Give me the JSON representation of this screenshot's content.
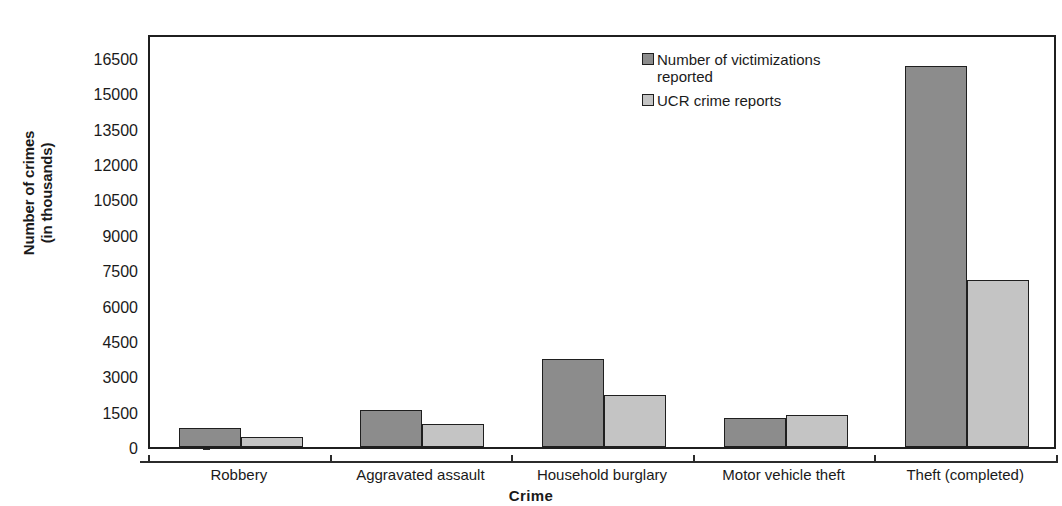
{
  "chart_data": {
    "type": "bar",
    "title": "",
    "xlabel": "Crime",
    "ylabel": "Number of crimes\n(in thousands)",
    "ylabel_lines": [
      "Number of crimes",
      "(in thousands)"
    ],
    "categories": [
      "Robbery",
      "Aggravated assault",
      "Household burglary",
      "Motor vehicle theft",
      "Theft (completed)"
    ],
    "series": [
      {
        "name": "Number of victimizations reported",
        "color": "#8c8c8c",
        "values": [
          800,
          1550,
          3750,
          1230,
          16150
        ]
      },
      {
        "name": "UCR crime reports",
        "color": "#c4c4c4",
        "values": [
          420,
          960,
          2200,
          1340,
          7100
        ]
      }
    ],
    "ylim": [
      0,
      17000
    ],
    "yticks": [
      0,
      1500,
      3000,
      4500,
      6000,
      7500,
      9000,
      10500,
      12000,
      13500,
      15000,
      16500
    ],
    "ytick_labels": [
      "0",
      "1500",
      "3000",
      "4500",
      "6000",
      "7500",
      "9000",
      "10500",
      "12000",
      "13500",
      "15000",
      "16500"
    ],
    "grid": false,
    "legend_position": "top-right",
    "legend_entries": [
      "Number of victimizations\nreported",
      "UCR crime reports"
    ]
  },
  "axis": {
    "x_title": "Crime",
    "y_title_line1": "Number of crimes",
    "y_title_line2": "(in thousands)"
  },
  "legend": {
    "entry_0": "Number of victimizations\nreported",
    "entry_1": "UCR crime reports"
  },
  "colors": {
    "series_0": "#8c8c8c",
    "series_1": "#c4c4c4",
    "axis": "#1f1f1f",
    "background": "#ffffff"
  }
}
